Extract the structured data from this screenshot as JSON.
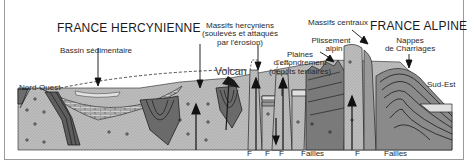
{
  "titles": {
    "left": "FRANCE HERCYNIENNE",
    "right": "FRANCE ALPINE"
  },
  "labels": {
    "bassin": "Bassin sédimentaire",
    "massifs_hercyniens": [
      "Massifs hercyniens",
      "(soulevés et attaqués",
      "par l'érosion)"
    ],
    "volcan": "Volcan",
    "plaines": [
      "Plaines",
      "d'effondrement",
      "(dépôts tertiaires)"
    ],
    "massifs_centraux": "Massifs centraux",
    "plissement": [
      "Plissement",
      "alpin"
    ],
    "nappes": [
      "Nappes",
      "de Charriages"
    ],
    "nord_ouest": "Nord-Ouest",
    "sud_est": "Sud-Est"
  },
  "fault_labels": [
    {
      "text": "F",
      "x": 247
    },
    {
      "text": "F",
      "x": 265
    },
    {
      "text": "F",
      "x": 279
    },
    {
      "text": "Failles",
      "x": 303
    },
    {
      "text": "F",
      "x": 356
    },
    {
      "text": "Failles",
      "x": 386
    }
  ],
  "colors": {
    "background": "#ffffff",
    "socle": "#b9b9b9",
    "fold_dark": "#6a6a6a",
    "sediment_light": "#d8d8d8",
    "line": "#1a1a1a",
    "text": "#2a2a2a"
  }
}
